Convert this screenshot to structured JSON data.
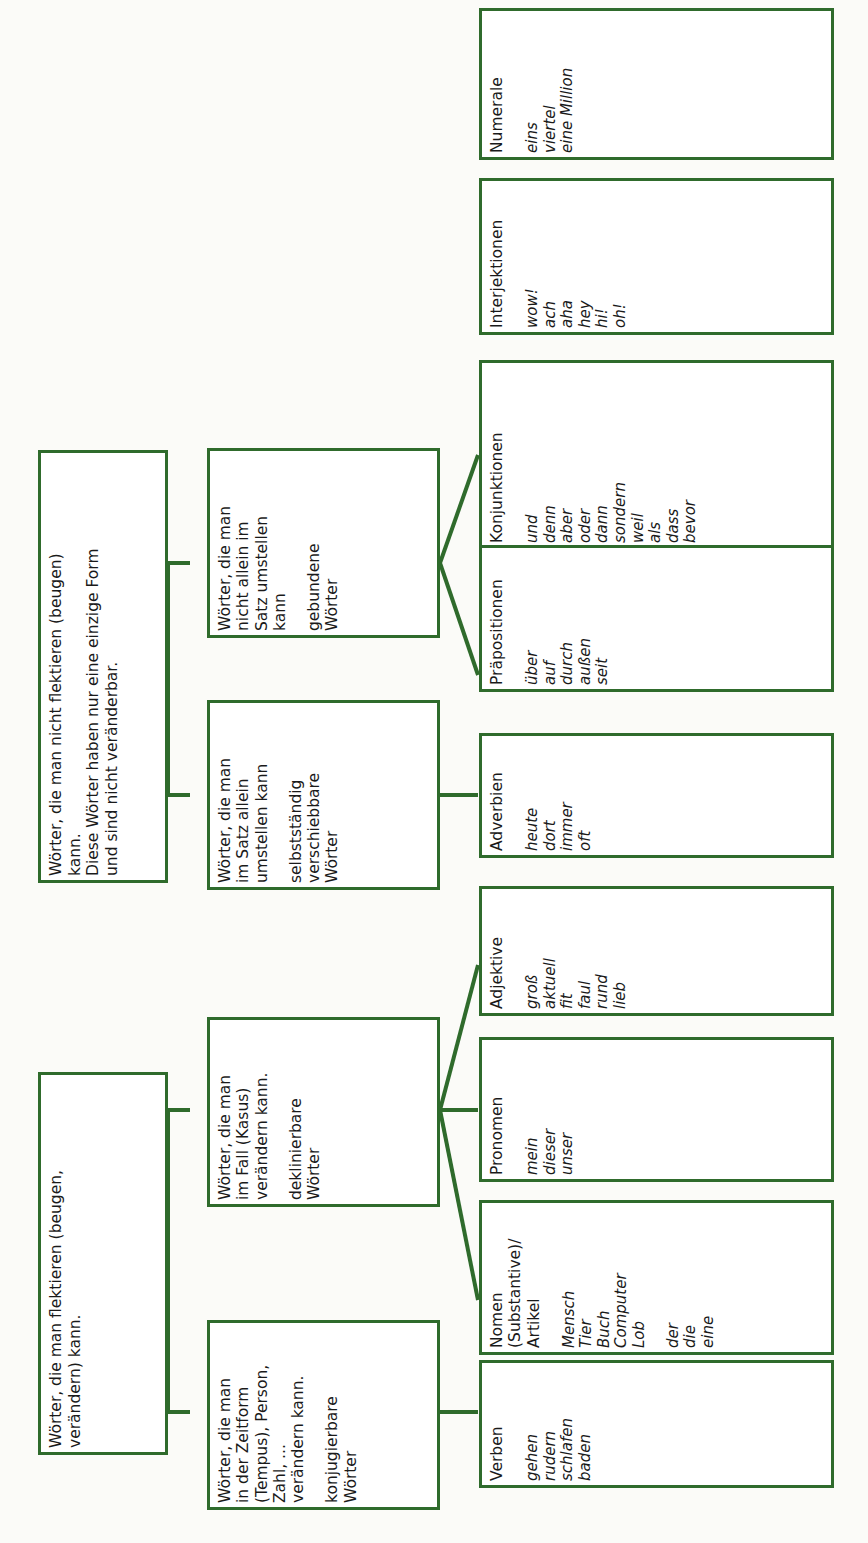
{
  "diagram": {
    "accent_color": "#2f6b2c",
    "background_color": "#fbfbf8",
    "text_color": "#1a1a1a",
    "orientation": "rotated-90-ccw"
  },
  "level1": [
    {
      "id": "unflektierbar",
      "description": "Wörter, die man nicht flektieren (beugen)\nkann.\nDiese Wörter haben nur eine einzige Form\nund sind nicht veränderbar."
    },
    {
      "id": "flektierbar",
      "description": "Wörter, die man flektieren (beugen,\nverändern) kann."
    }
  ],
  "level2": [
    {
      "id": "gebundene",
      "description": "Wörter, die man\nnicht allein im\nSatz umstellen\nkann",
      "label": "gebundene\nWörter"
    },
    {
      "id": "selbststaendig",
      "description": "Wörter, die man\nim Satz allein\numstellen kann",
      "label": "selbstständig\nverschiebbare\nWörter"
    },
    {
      "id": "deklinierbar",
      "description": "Wörter, die man\nim Fall (Kasus)\nverändern kann.",
      "label": "deklinierbare\nWörter"
    },
    {
      "id": "konjugierbar",
      "description": "Wörter, die man\nin der Zeitform\n(Tempus), Person,\nZahl, ...\nverändern kann.",
      "label": "konjugierbare\nWörter"
    }
  ],
  "wordclasses": [
    {
      "id": "numerale",
      "title": "Numerale",
      "examples": "eins\nviertel\neine Million",
      "examples2": ""
    },
    {
      "id": "interjektionen",
      "title": "Interjektionen",
      "examples": "wow!\nach\naha\nhey\nhi!\noh!",
      "examples2": ""
    },
    {
      "id": "konjunktionen",
      "title": "Konjunktionen",
      "examples": "und\ndenn\naber\noder\ndann\nsondern\nweil\nals\ndass\nbevor",
      "examples2": ""
    },
    {
      "id": "praepositionen",
      "title": "Präpositionen",
      "examples": "über\nauf\ndurch\naußen\nseit",
      "examples2": ""
    },
    {
      "id": "adverbien",
      "title": "Adverbien",
      "examples": "heute\ndort\nimmer\noft",
      "examples2": ""
    },
    {
      "id": "adjektive",
      "title": "Adjektive",
      "examples": "groß\naktuell\nfit\nfaul\nrund\nlieb",
      "examples2": ""
    },
    {
      "id": "pronomen",
      "title": "Pronomen",
      "examples": "mein\ndieser\nunser",
      "examples2": ""
    },
    {
      "id": "nomen",
      "title": "Nomen\n(Substantive)/\nArtikel",
      "examples": "Mensch\nTier\nBuch\nComputer\nLob",
      "examples2": "der\ndie\neine"
    },
    {
      "id": "verben",
      "title": "Verben",
      "examples": "gehen\nrudern\nschlafen\nbaden",
      "examples2": ""
    }
  ]
}
